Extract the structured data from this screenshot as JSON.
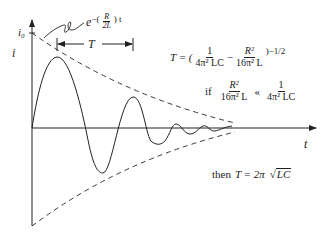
{
  "diagram": {
    "type": "damped-oscillation-rlc",
    "axes": {
      "y_label": "i",
      "y_initial_label": "i₀",
      "x_label": "t"
    },
    "envelope_label": {
      "base": "e",
      "exponent_sign": "−(",
      "exponent_num": "R",
      "exponent_den": "2L",
      "exponent_close": ") t"
    },
    "period_label": "T",
    "equations": {
      "period": {
        "lhs": "T = (",
        "term1_num": "1",
        "term1_den": "4π² LC",
        "minus": "−",
        "term2_num": "R²",
        "term2_den": "16π² L",
        "exponent": ")−1/2"
      },
      "condition": {
        "if": "if",
        "lhs_num": "R²",
        "lhs_den": "16π² L",
        "relation": "«",
        "rhs_num": "1",
        "rhs_den": "4π² LC"
      },
      "result": {
        "prefix": "then",
        "lhs": "T = 2π",
        "radicand": "LC"
      }
    },
    "colors": {
      "stroke": "#222222",
      "background": "#ffffff"
    }
  }
}
